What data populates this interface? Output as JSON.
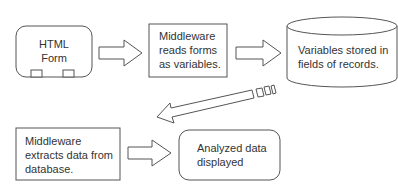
{
  "diagram": {
    "type": "flowchart",
    "stroke_color": "#555555",
    "nodes": [
      {
        "id": "html-form",
        "shape": "rounded-rect-with-tabs",
        "lines": [
          "HTML",
          "Form"
        ]
      },
      {
        "id": "middleware-read",
        "shape": "rect",
        "lines": [
          "Middleware",
          "reads forms",
          "as variables."
        ]
      },
      {
        "id": "database",
        "shape": "cylinder",
        "lines": [
          "Variables stored in",
          "fields of records."
        ]
      },
      {
        "id": "middleware-extract",
        "shape": "rect",
        "lines": [
          "Middleware",
          "extracts data from",
          "database."
        ]
      },
      {
        "id": "analyzed",
        "shape": "rounded-rect",
        "lines": [
          "Analyzed data",
          "displayed"
        ]
      }
    ],
    "edges": [
      {
        "from": "html-form",
        "to": "middleware-read",
        "style": "block-arrow"
      },
      {
        "from": "middleware-read",
        "to": "database",
        "style": "block-arrow"
      },
      {
        "from": "database",
        "to": "middleware-extract",
        "style": "striped-block-arrow"
      },
      {
        "from": "middleware-extract",
        "to": "analyzed",
        "style": "block-arrow"
      }
    ]
  }
}
